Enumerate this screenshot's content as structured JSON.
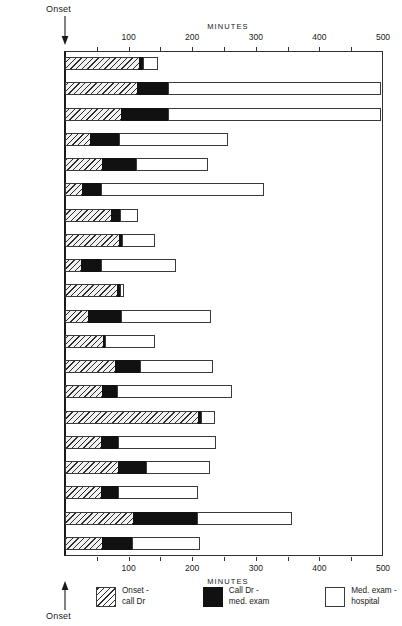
{
  "title_top": "MINUTES",
  "title_bottom": "MINUTES",
  "onset_label_top": "Onset",
  "onset_label_bottom": "Onset",
  "axis": {
    "min": 0,
    "max": 500,
    "major_ticks": [
      0,
      100,
      200,
      300,
      400,
      500
    ],
    "minor_tick_step": 50,
    "tick_labels": [
      "",
      "100",
      "200",
      "300",
      "400",
      "500"
    ]
  },
  "colors": {
    "onset_call_dr": "#f2f2f2",
    "call_dr_exam": "#111111",
    "exam_hospital": "#ffffff",
    "frame": "#333333"
  },
  "legend": [
    {
      "key": "onset",
      "line1": "Onset -",
      "line2": "call Dr"
    },
    {
      "key": "call",
      "line1": "Call Dr -",
      "line2": "med. exam"
    },
    {
      "key": "exam",
      "line1": "Med. exam -",
      "line2": "hospital"
    }
  ],
  "chart_data": {
    "type": "bar",
    "orientation": "horizontal",
    "stacked": true,
    "title": "MINUTES",
    "xlabel": "MINUTES",
    "ylabel": "",
    "xlim": [
      0,
      500
    ],
    "grid": false,
    "legend_position": "bottom",
    "annotations": [
      "Onset (top arrow at x=0)",
      "Onset (bottom arrow at x=0)"
    ],
    "series": [
      {
        "name": "Onset - call Dr",
        "values": [
          118,
          115,
          90,
          41,
          60,
          28,
          74,
          86,
          27,
          83,
          38,
          61,
          80,
          60,
          211,
          58,
          85,
          58,
          108,
          60
        ]
      },
      {
        "name": "Call Dr - med. exam",
        "values": [
          8,
          50,
          75,
          47,
          55,
          32,
          16,
          7,
          33,
          7,
          53,
          5,
          41,
          25,
          6,
          28,
          46,
          28,
          103,
          48
        ]
      },
      {
        "name": "Med. exam - hospital",
        "values": [
          23,
          335,
          335,
          171,
          113,
          256,
          28,
          52,
          118,
          6,
          142,
          79,
          115,
          181,
          22,
          154,
          100,
          126,
          149,
          107
        ]
      }
    ],
    "categories": [
      "Gothenburg",
      "Prague",
      "Bucharest",
      "Budapest",
      "Dublin",
      "Heidelberg",
      "Helsinki",
      "London",
      "Nijmegen",
      "Tampere",
      "Warsaw",
      "Lublin",
      "Innsbruck",
      "Kaunas",
      "Boden",
      "Sofia",
      "Perth",
      "Tel Aviv",
      "Berlin",
      "Total"
    ],
    "cumulative_totals": [
      149,
      500,
      500,
      259,
      228,
      316,
      118,
      145,
      178,
      96,
      233,
      145,
      236,
      266,
      239,
      240,
      231,
      212,
      360,
      215
    ]
  }
}
